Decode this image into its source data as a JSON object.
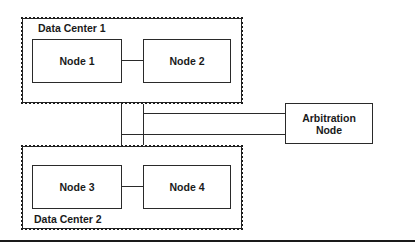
{
  "diagram": {
    "data_centers": [
      {
        "id": "dc1",
        "label": "Data Center 1",
        "nodes": [
          {
            "label": "Node 1"
          },
          {
            "label": "Node 2"
          }
        ]
      },
      {
        "id": "dc2",
        "label": "Data Center 2",
        "nodes": [
          {
            "label": "Node 3"
          },
          {
            "label": "Node 4"
          }
        ]
      }
    ],
    "arbitration_node": {
      "line1": "Arbitration",
      "line2": "Node"
    },
    "connections": [
      {
        "from": "Node 1",
        "to": "Node 2"
      },
      {
        "from": "Node 3",
        "to": "Node 4"
      },
      {
        "from": "Data Center 1",
        "to": "Data Center 2"
      },
      {
        "from": "Data Center 1",
        "to": "Arbitration Node"
      },
      {
        "from": "Data Center 2",
        "to": "Arbitration Node"
      }
    ]
  }
}
